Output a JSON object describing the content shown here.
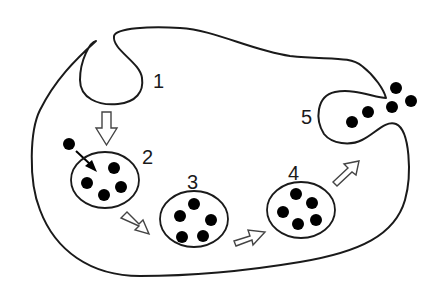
{
  "diagram": {
    "colors": {
      "stroke": "#1a1a1a",
      "particle": "#000000",
      "arrow_fill": "#ffffff",
      "background": "#ffffff"
    },
    "stages": [
      {
        "id": 1,
        "label": "1",
        "description": "membrane invagination"
      },
      {
        "id": 2,
        "label": "2",
        "description": "vesicle with particle entering",
        "particles": 4
      },
      {
        "id": 3,
        "label": "3",
        "description": "vesicle",
        "particles": 5
      },
      {
        "id": 4,
        "label": "4",
        "description": "vesicle",
        "particles": 5
      },
      {
        "id": 5,
        "label": "5",
        "description": "exocytosis release",
        "particles": 5
      }
    ],
    "arrows": [
      {
        "from": "1",
        "to": "2",
        "style": "open-outline"
      },
      {
        "from": "2",
        "to": "3",
        "style": "open-outline"
      },
      {
        "from": "3",
        "to": "4",
        "style": "open-outline"
      },
      {
        "from": "4",
        "to": "5",
        "style": "open-outline"
      },
      {
        "from": "external-particle",
        "to": "2",
        "style": "solid-black"
      }
    ]
  }
}
